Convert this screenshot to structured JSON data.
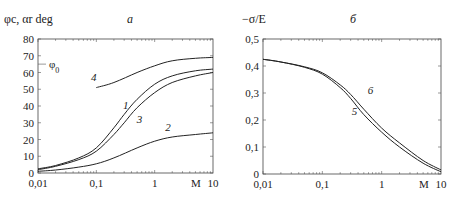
{
  "chart_data": [
    {
      "type": "line",
      "panel": "a",
      "title": "а",
      "xlabel": "M",
      "ylabel": "φc, αr deg",
      "xscale": "log",
      "xlim": [
        0.01,
        10
      ],
      "ylim": [
        0,
        80
      ],
      "xticks": [
        "0,01",
        "0,1",
        "1",
        "10"
      ],
      "yticks": [
        "0",
        "10",
        "20",
        "30",
        "40",
        "50",
        "60",
        "70",
        "80"
      ],
      "grid": false,
      "annotations": [
        {
          "text": "φ0",
          "y": 65,
          "note": "reference mark on y-axis"
        }
      ],
      "series": [
        {
          "name": "1",
          "x": [
            0.01,
            0.02,
            0.05,
            0.1,
            0.2,
            0.3,
            0.5,
            1,
            2,
            5,
            10
          ],
          "y": [
            2.5,
            4.5,
            9,
            15,
            27,
            35,
            44,
            53,
            58,
            61,
            62
          ]
        },
        {
          "name": "2",
          "x": [
            0.01,
            0.02,
            0.05,
            0.1,
            0.2,
            0.5,
            1,
            2,
            5,
            10
          ],
          "y": [
            1,
            1.8,
            3.5,
            5.5,
            9,
            15,
            19,
            21.5,
            23,
            24
          ]
        },
        {
          "name": "3",
          "x": [
            0.01,
            0.02,
            0.05,
            0.1,
            0.2,
            0.3,
            0.5,
            1,
            2,
            5,
            10
          ],
          "y": [
            2,
            4,
            8,
            13,
            23,
            30,
            39,
            48,
            54,
            58,
            60
          ]
        },
        {
          "name": "4",
          "x": [
            0.1,
            0.2,
            0.5,
            1,
            2,
            5,
            10
          ],
          "y": [
            51,
            54,
            60,
            64,
            67,
            68.5,
            69
          ]
        }
      ],
      "curve_labels": [
        {
          "text": "1",
          "x": 0.32,
          "y": 38
        },
        {
          "text": "2",
          "x": 1.7,
          "y": 25
        },
        {
          "text": "3",
          "x": 0.55,
          "y": 30
        },
        {
          "text": "4",
          "x": 0.09,
          "y": 55
        }
      ]
    },
    {
      "type": "line",
      "panel": "б",
      "title": "б",
      "xlabel": "M",
      "ylabel": "−σ/E",
      "xscale": "log",
      "xlim": [
        0.01,
        10
      ],
      "ylim": [
        0,
        0.5
      ],
      "xticks": [
        "0,01",
        "0,1",
        "1",
        "10"
      ],
      "yticks": [
        "0",
        "0,1",
        "0,2",
        "0,3",
        "0,4",
        "0,5"
      ],
      "grid": false,
      "series": [
        {
          "name": "5",
          "x": [
            0.01,
            0.02,
            0.05,
            0.1,
            0.2,
            0.3,
            0.5,
            1,
            2,
            5,
            10
          ],
          "y": [
            0.425,
            0.415,
            0.395,
            0.37,
            0.32,
            0.28,
            0.22,
            0.155,
            0.1,
            0.04,
            0.008
          ]
        },
        {
          "name": "6",
          "x": [
            0.01,
            0.02,
            0.05,
            0.1,
            0.2,
            0.3,
            0.5,
            1,
            2,
            5,
            10
          ],
          "y": [
            0.425,
            0.415,
            0.397,
            0.375,
            0.33,
            0.295,
            0.24,
            0.17,
            0.115,
            0.05,
            0.015
          ]
        }
      ],
      "curve_labels": [
        {
          "text": "5",
          "x": 0.35,
          "y": 0.22
        },
        {
          "text": "6",
          "x": 0.65,
          "y": 0.295
        }
      ]
    }
  ]
}
